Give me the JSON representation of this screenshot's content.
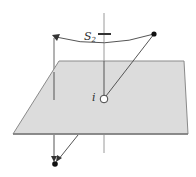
{
  "diagram": {
    "labels": {
      "rotation_axis": "S",
      "rotation_axis_subscript": "2",
      "inversion_center": "i"
    },
    "colors": {
      "plane_fill": "#d9d9d9",
      "plane_stroke": "#8a8a8a",
      "line": "#555555",
      "axis": "#9a9a9a",
      "dot": "#111111",
      "open_circle_fill": "#ffffff"
    },
    "elements": [
      "principal-axis",
      "mirror-plane",
      "rotation-arc",
      "original-point",
      "inverted-point",
      "inversion-center"
    ]
  }
}
